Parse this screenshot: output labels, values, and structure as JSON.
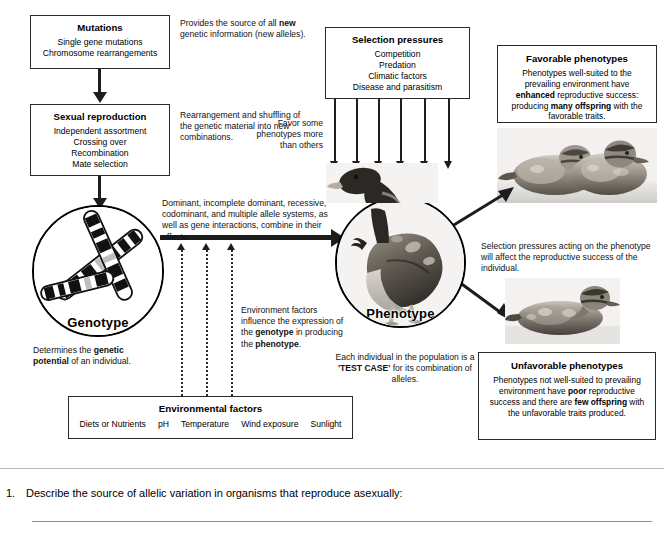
{
  "diagram": {
    "boxes": {
      "mutations": {
        "heading": "Mutations",
        "lines": [
          "Single gene mutations",
          "Chromosome rearrangements"
        ]
      },
      "sexual_reproduction": {
        "heading": "Sexual reproduction",
        "lines": [
          "Independent assortment",
          "Crossing over",
          "Recombination",
          "Mate selection"
        ]
      },
      "selection_pressures": {
        "heading": "Selection pressures",
        "lines": [
          "Competition",
          "Predation",
          "Climatic factors",
          "Disease and parasitism"
        ]
      },
      "favorable_phenotypes": {
        "heading": "Favorable phenotypes",
        "body_part1": "Phenotypes well-suited to the prevailing environment have ",
        "body_bold1": "enhanced",
        "body_part2": " reproductive success: producing ",
        "body_bold2": "many offspring",
        "body_part3": " with the favorable traits."
      },
      "unfavorable_phenotypes": {
        "heading": "Unfavorable phenotypes",
        "body_part1": "Phenotypes not well-suited to prevailing environment have ",
        "body_bold1": "poor",
        "body_part2": " reproductive success and there are ",
        "body_bold2": "few offspring",
        "body_part3": " with the unfavorable traits produced."
      },
      "environmental_factors": {
        "heading": "Environmental factors",
        "items": [
          "Diets or Nutrients",
          "pH",
          "Temperature",
          "Wind exposure",
          "Sunlight"
        ]
      }
    },
    "circles": {
      "genotype": {
        "label": "Genotype",
        "content": "chromosomes-illustration"
      },
      "phenotype": {
        "label": "Phenotype",
        "content": "duck-photograph"
      }
    },
    "annotations": {
      "mutations_note": {
        "part1": "Provides the source of all ",
        "bold1": "new",
        "part2": " genetic information (new alleles)."
      },
      "sexual_note": "Rearrangement and shuffling of the genetic material into new combinations.",
      "favor_note": "Favor some phenotypes more than others",
      "allele_note": "Dominant, incomplete dominant, recessive, codominant, and multiple allele systems, as well as gene interactions, combine in their effects.",
      "genotype_note": {
        "part1": "Determines the ",
        "bold1": "genetic potential",
        "part2": " of an individual."
      },
      "environment_note": {
        "part1": "Environment factors influence the expression of the ",
        "bold1": "genotype",
        "part2": " in producing the ",
        "bold2": "phenotype",
        "part3": "."
      },
      "selection_note": "Selection pressures acting on the phenotype will affect the reproductive success of the individual.",
      "testcase_note": {
        "part1": "Each individual in the population is a ",
        "bold1": "'TEST CASE'",
        "part2": " for its combination of alleles."
      }
    },
    "images": {
      "favorable": "two-ducklings-photo",
      "unfavorable": "single-duckling-photo",
      "phenotype_duck": "adult-duck-photo"
    }
  },
  "question": {
    "number": "1.",
    "text": "Describe the source of allelic variation in organisms that reproduce asexually:"
  },
  "colors": {
    "ink": "#1d1d1d",
    "box_border": "#2a2a2a",
    "rule": "#b9b9b9",
    "answer_line": "#8d8d8d",
    "page_bg": "#ffffff"
  }
}
